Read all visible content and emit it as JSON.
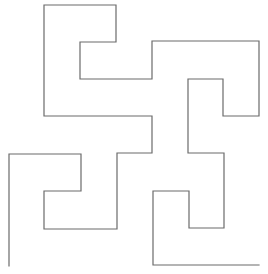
{
  "diagram": {
    "type": "hilbert-like-curve",
    "stroke_color": "#6b6b6b",
    "background_color": "#ffffff",
    "segments_count": 31
  }
}
